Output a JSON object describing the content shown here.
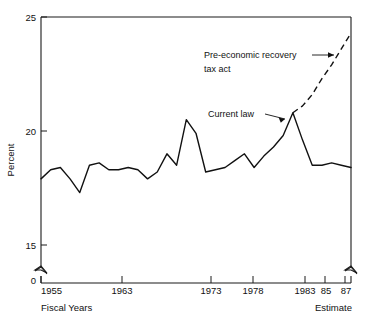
{
  "chart_data": {
    "type": "line",
    "title": "",
    "subtitle": "",
    "xlabel": "Fiscal Years",
    "ylabel": "Percent",
    "xlim": [
      1955,
      1987
    ],
    "ylim": [
      15,
      25
    ],
    "y_axis_break": true,
    "y_break_label": "0",
    "grid": false,
    "legend": "none",
    "y_ticks": [
      15,
      20,
      25
    ],
    "y_tick_labels": [
      "15",
      "20",
      "25"
    ],
    "x_ticks": [
      1955,
      1963,
      1973,
      1978,
      1983,
      1985,
      1987
    ],
    "x_tick_labels": [
      "1955",
      "1963",
      "1973",
      "1978",
      "1983",
      "85",
      "87"
    ],
    "x": [
      1955,
      1956,
      1957,
      1958,
      1959,
      1960,
      1961,
      1962,
      1963,
      1964,
      1965,
      1966,
      1967,
      1968,
      1969,
      1970,
      1971,
      1972,
      1973,
      1974,
      1975,
      1976,
      1977,
      1978,
      1979,
      1980,
      1981,
      1982,
      1983,
      1984,
      1985,
      1986,
      1987
    ],
    "series": [
      {
        "name": "Current law",
        "style": "solid",
        "values": [
          17.9,
          18.3,
          18.4,
          17.9,
          17.3,
          18.5,
          18.6,
          18.3,
          18.3,
          18.4,
          18.3,
          17.9,
          18.2,
          19.0,
          18.5,
          20.5,
          19.9,
          18.2,
          18.3,
          18.4,
          18.7,
          19.0,
          18.4,
          18.9,
          19.3,
          19.8,
          20.8,
          19.6,
          18.5,
          18.5,
          18.6,
          18.5,
          18.4
        ],
        "note": "solid line, actual and current-law projection"
      },
      {
        "name": "Pre-economic recovery tax act",
        "style": "dashed",
        "x": [
          1981,
          1982,
          1983,
          1984,
          1985,
          1986,
          1987
        ],
        "values": [
          20.8,
          21.1,
          21.6,
          22.3,
          22.9,
          23.6,
          24.3
        ],
        "note": "dashed line, pre-act baseline projection"
      }
    ],
    "annotations": [
      {
        "id": "annot-pre-act",
        "text_line1": "Pre-economic recovery",
        "text_line2": "tax act",
        "points_to": "dashed-line",
        "arrow": "right"
      },
      {
        "id": "annot-current-law",
        "text_line1": "Current law",
        "text_line2": "",
        "points_to": "solid-line-peak",
        "arrow": "right"
      }
    ],
    "footnotes": {
      "left": "Fiscal Years",
      "right": "Estimate"
    }
  },
  "axis": {
    "y_label": "Percent",
    "y_tick_25": "25",
    "y_tick_20": "20",
    "y_tick_15": "15",
    "y_zero": "0",
    "x_tick_1955": "1955",
    "x_tick_1963": "1963",
    "x_tick_1973": "1973",
    "x_tick_1978": "1978",
    "x_tick_1983": "1983",
    "x_tick_85": "85",
    "x_tick_87": "87"
  },
  "captions": {
    "fiscal_years": "Fiscal Years",
    "estimate": "Estimate"
  },
  "annotations": {
    "pre_act_line1": "Pre-economic recovery",
    "pre_act_line2": "tax act",
    "current_law": "Current law"
  },
  "colors": {
    "ink": "#111111",
    "background": "#ffffff"
  }
}
